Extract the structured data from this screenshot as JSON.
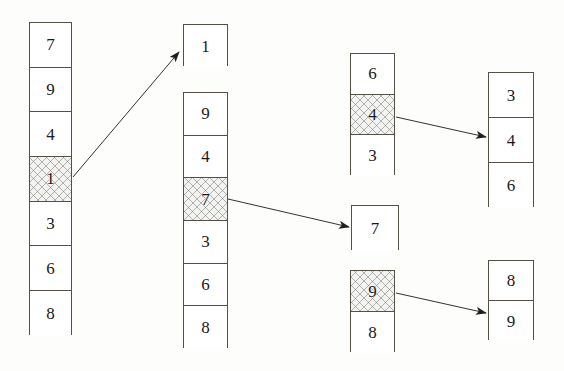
{
  "diagram": {
    "background_color": "#fdfdfc",
    "border_color": "#555047",
    "highlight_fill": "#f3f3f1",
    "arrow_color": "#333333",
    "stacks": [
      {
        "id": "source-list",
        "name": "source-list",
        "x": 29,
        "y": 22,
        "w": 43,
        "cell_h": 44.7,
        "cells": [
          {
            "value": "7",
            "highlighted": false
          },
          {
            "value": "9",
            "highlighted": false
          },
          {
            "value": "4",
            "highlighted": false
          },
          {
            "value": "1",
            "highlighted": true
          },
          {
            "value": "3",
            "highlighted": false
          },
          {
            "value": "6",
            "highlighted": false
          },
          {
            "value": "8",
            "highlighted": false
          }
        ]
      },
      {
        "id": "extracted-one",
        "name": "extracted-one-box",
        "x": 183,
        "y": 24,
        "w": 45,
        "cell_h": 42,
        "cells": [
          {
            "value": "1",
            "highlighted": false
          }
        ]
      },
      {
        "id": "remaining-list",
        "name": "remaining-list",
        "x": 183,
        "y": 92,
        "w": 45,
        "cell_h": 42.7,
        "cells": [
          {
            "value": "9",
            "highlighted": false
          },
          {
            "value": "4",
            "highlighted": false
          },
          {
            "value": "7",
            "highlighted": true
          },
          {
            "value": "3",
            "highlighted": false
          },
          {
            "value": "6",
            "highlighted": false
          },
          {
            "value": "8",
            "highlighted": false
          }
        ]
      },
      {
        "id": "group-643",
        "name": "group-six-four-three",
        "x": 350,
        "y": 53,
        "w": 45,
        "cell_h": 40.7,
        "cells": [
          {
            "value": "6",
            "highlighted": false
          },
          {
            "value": "4",
            "highlighted": true
          },
          {
            "value": "3",
            "highlighted": false
          }
        ]
      },
      {
        "id": "group-346",
        "name": "group-three-four-six",
        "x": 488,
        "y": 72,
        "w": 46,
        "cell_h": 45,
        "cells": [
          {
            "value": "3",
            "highlighted": false
          },
          {
            "value": "4",
            "highlighted": false
          },
          {
            "value": "6",
            "highlighted": false
          }
        ]
      },
      {
        "id": "extracted-seven",
        "name": "extracted-seven-box",
        "x": 351,
        "y": 205,
        "w": 48,
        "cell_h": 45,
        "cells": [
          {
            "value": "7",
            "highlighted": false
          }
        ]
      },
      {
        "id": "group-98",
        "name": "group-nine-eight",
        "x": 350,
        "y": 270,
        "w": 45,
        "cell_h": 41,
        "cells": [
          {
            "value": "9",
            "highlighted": true
          },
          {
            "value": "8",
            "highlighted": false
          }
        ]
      },
      {
        "id": "group-89",
        "name": "group-eight-nine",
        "x": 488,
        "y": 260,
        "w": 46,
        "cell_h": 40,
        "cells": [
          {
            "value": "8",
            "highlighted": false
          },
          {
            "value": "9",
            "highlighted": false
          }
        ]
      }
    ],
    "arrows": [
      {
        "id": "arrow-one",
        "name": "arrow-one-to-extracted",
        "x1": 73,
        "y1": 177,
        "x2": 179,
        "y2": 52
      },
      {
        "id": "arrow-seven",
        "name": "arrow-seven-to-extracted",
        "x1": 228,
        "y1": 199,
        "x2": 349,
        "y2": 227
      },
      {
        "id": "arrow-four",
        "name": "arrow-four-to-group",
        "x1": 396,
        "y1": 117,
        "x2": 486,
        "y2": 137
      },
      {
        "id": "arrow-nine",
        "name": "arrow-nine-to-group",
        "x1": 396,
        "y1": 293,
        "x2": 486,
        "y2": 313
      }
    ]
  }
}
